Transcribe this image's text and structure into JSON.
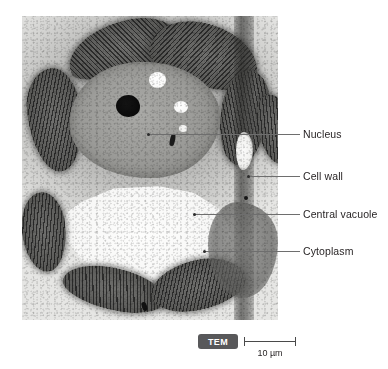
{
  "figure": {
    "type": "electron-micrograph",
    "labels": [
      {
        "id": "nucleus",
        "text": "Nucleus"
      },
      {
        "id": "cell-wall",
        "text": "Cell wall"
      },
      {
        "id": "central-vacuole",
        "text": "Central vacuole"
      },
      {
        "id": "cytoplasm",
        "text": "Cytoplasm"
      }
    ],
    "footer": {
      "technique_badge": "TEM",
      "scale_value": "10 µm"
    },
    "colors": {
      "label_text": "#231f20",
      "leader_line": "#6e6e6e",
      "badge_background": "#58585a",
      "badge_text": "#ffffff",
      "scale_line": "#4a4a4a"
    }
  }
}
